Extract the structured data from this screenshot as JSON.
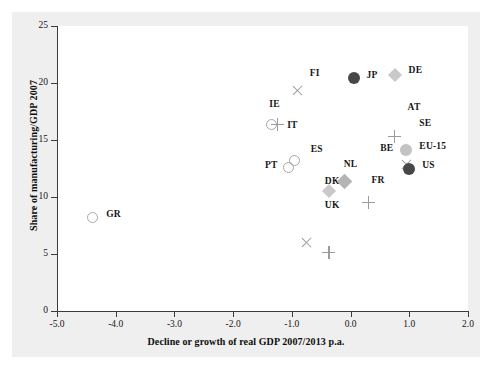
{
  "chart_data": {
    "type": "scatter",
    "title": "",
    "xlabel": "Decline or growth of real GDP 2007/2013 p.a.",
    "ylabel": "Share of manufacturing/GDP 2007",
    "xlim": [
      -5.0,
      2.0
    ],
    "ylim": [
      0,
      25
    ],
    "xticks": [
      "-5.0",
      "-4.0",
      "-3.0",
      "-2.0",
      "-1.0",
      "0.0",
      "1.0",
      "2.0"
    ],
    "xtick_values": [
      -5.0,
      -4.0,
      -3.0,
      -2.0,
      -1.0,
      0.0,
      1.0,
      2.0
    ],
    "yticks": [
      "0",
      "5",
      "10",
      "15",
      "20",
      "25"
    ],
    "ytick_values": [
      0,
      5,
      10,
      15,
      20,
      25
    ],
    "grid": false,
    "legend": "none",
    "points": [
      {
        "label": "GR",
        "x": -4.4,
        "y": 8.2,
        "marker": "circle-open",
        "color": "#a8a8a8",
        "label_dx": 14,
        "label_dy": -4
      },
      {
        "label": "IE",
        "x": -1.35,
        "y": 16.4,
        "marker": "circle-open",
        "color": "#a8a8a8",
        "label_dx": -2,
        "label_dy": -20
      },
      {
        "label": "IT",
        "x": -1.25,
        "y": 16.4,
        "marker": "plus",
        "color": "#9b9b9b",
        "label_dx": 10,
        "label_dy": 1
      },
      {
        "label": "FI",
        "x": -0.9,
        "y": 20.5,
        "marker": "ex",
        "color": "#9b9b9b",
        "label_dx": 12,
        "label_dy": -4
      },
      {
        "label": "JP",
        "x": 0.05,
        "y": 20.4,
        "marker": "circle-dark",
        "color": "#474747",
        "label_dx": 13,
        "label_dy": -3
      },
      {
        "label": "DE",
        "x": 0.75,
        "y": 20.7,
        "marker": "diamond-light",
        "color": "#c9c9c9",
        "label_dx": 14,
        "label_dy": -5
      },
      {
        "label": "AT",
        "x": 0.75,
        "y": 17.6,
        "marker": "plus",
        "color": "#9b9b9b",
        "label_dx": 13,
        "label_dy": -3
      },
      {
        "label": "SE",
        "x": 0.95,
        "y": 16.3,
        "marker": "ex",
        "color": "#9b9b9b",
        "label_dx": 13,
        "label_dy": -2
      },
      {
        "label": "BE",
        "x": 0.3,
        "y": 14.1,
        "marker": "plus",
        "color": "#9b9b9b",
        "label_dx": 12,
        "label_dy": -2
      },
      {
        "label": "EU-15",
        "x": 0.95,
        "y": 14.1,
        "marker": "circle-light",
        "color": "#c3c3c3",
        "label_dx": 13,
        "label_dy": -4
      },
      {
        "label": "US",
        "x": 1.0,
        "y": 12.5,
        "marker": "circle-dark",
        "color": "#474747",
        "label_dx": 13,
        "label_dy": -4
      },
      {
        "label": "ES",
        "x": -0.95,
        "y": 13.2,
        "marker": "circle-open",
        "color": "#a8a8a8",
        "label_dx": 16,
        "label_dy": -12
      },
      {
        "label": "PT",
        "x": -1.05,
        "y": 12.6,
        "marker": "circle-open",
        "color": "#a8a8a8",
        "label_dx": -24,
        "label_dy": -2
      },
      {
        "label": "ES-x",
        "x": -0.75,
        "y": 11.7,
        "marker": "ex",
        "color": "#9b9b9b",
        "label_dx": 0,
        "label_dy": 0
      },
      {
        "label": "DK",
        "x": -0.37,
        "y": 12.0,
        "marker": "plus",
        "color": "#9b9b9b",
        "label_dx": -4,
        "label_dy": 7
      },
      {
        "label": "NL",
        "x": -0.1,
        "y": 11.4,
        "marker": "diamond-mid",
        "color": "#b4b4b4",
        "label_dx": -1,
        "label_dy": -17
      },
      {
        "label": "FR",
        "x": 0.12,
        "y": 11.3,
        "marker": "none",
        "color": "#b4b4b4",
        "label_dx": 14,
        "label_dy": -2
      },
      {
        "label": "UK",
        "x": -0.37,
        "y": 10.5,
        "marker": "diamond-light",
        "color": "#c9c9c9",
        "label_dx": -4,
        "label_dy": 14
      }
    ]
  },
  "axis": {
    "xlabel": "Decline or growth of real GDP 2007/2013 p.a.",
    "ylabel": "Share of manufacturing/GDP 2007"
  }
}
